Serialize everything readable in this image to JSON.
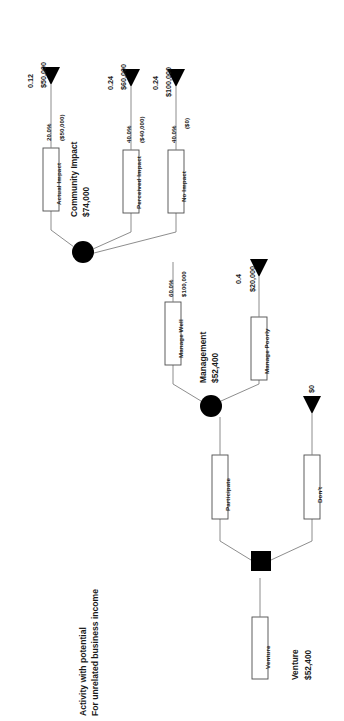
{
  "diagram": {
    "title_line1": "Activity with potential",
    "title_line2": "For unrelated business income",
    "root": {
      "branch_label": "Venture",
      "node_name": "Venture",
      "node_value": "$52,400"
    },
    "decision_node": {
      "type": "decision-square",
      "name": "venture-decision-node"
    },
    "decision_branches": [
      {
        "label": "Participate",
        "leads_to": "management-chance-node"
      },
      {
        "label": "Don't",
        "payoff_value": "$0",
        "payoff_prob": ""
      }
    ],
    "management_node": {
      "name": "Management",
      "value": "$52,400",
      "type": "chance-circle"
    },
    "management_branches": [
      {
        "label": "Manage Well",
        "probability": "60.0%",
        "cost": "$100,000",
        "leads_to": "community-impact-chance-node"
      },
      {
        "label": "Manage Poorly",
        "probability": "",
        "cost": "",
        "payoff_prob": "0.4",
        "payoff_value": "$20,000"
      }
    ],
    "community_node": {
      "name": "Community Impact",
      "value": "$74,000",
      "type": "chance-circle"
    },
    "community_branches": [
      {
        "label": "Actual Impact",
        "probability": "20.0%",
        "cost": "($50,000)",
        "payoff_prob": "0.12",
        "payoff_value": "$50,000"
      },
      {
        "label": "Perceived Impact",
        "probability": "40.0%",
        "cost": "($40,000)",
        "payoff_prob": "0.24",
        "payoff_value": "$60,000"
      },
      {
        "label": "No Impact",
        "probability": "40.0%",
        "cost": "($0)",
        "payoff_prob": "0.24",
        "payoff_value": "$100,000"
      }
    ],
    "colors": {
      "line": "#4d4d4d",
      "node_fill": "#000000",
      "box_stroke": "#4d4d4d",
      "box_fill": "#ffffff",
      "text": "#1a1a1a"
    }
  }
}
